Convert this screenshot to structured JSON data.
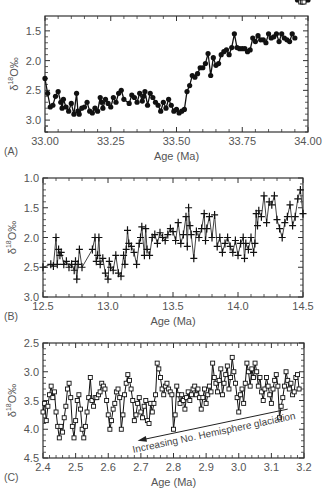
{
  "figure": {
    "panels": [
      "A",
      "B",
      "C"
    ]
  },
  "chart_data": [
    {
      "type": "line",
      "panel_label": "(A)",
      "title": "",
      "xlabel": "Age (Ma)",
      "ylabel": "δ18O‰",
      "ylabel_parts": {
        "delta": "δ",
        "sup": "18",
        "rest": "O‰"
      },
      "marker": "filled-circle",
      "y_inverted": true,
      "xlim": [
        33.0,
        34.0
      ],
      "ylim": [
        3.2,
        1.25
      ],
      "xticks": [
        33.0,
        33.25,
        33.5,
        33.75,
        34.0
      ],
      "xtick_labels": [
        "33.00",
        "33.25",
        "33.50",
        "33.75",
        "34.00"
      ],
      "yticks": [
        1.5,
        2.0,
        2.5,
        3.0
      ],
      "ytick_labels": [
        "1.5",
        "2.0",
        "2.5",
        "3.0"
      ],
      "frame_px": {
        "left": 45,
        "right": 308,
        "top": 16,
        "bottom": 132
      },
      "x": [
        33.0,
        33.01,
        33.02,
        33.03,
        33.04,
        33.05,
        33.06,
        33.065,
        33.07,
        33.08,
        33.09,
        33.1,
        33.11,
        33.12,
        33.125,
        33.13,
        33.14,
        33.15,
        33.16,
        33.17,
        33.18,
        33.19,
        33.2,
        33.21,
        33.215,
        33.22,
        33.23,
        33.24,
        33.25,
        33.26,
        33.27,
        33.28,
        33.29,
        33.3,
        33.32,
        33.33,
        33.34,
        33.35,
        33.36,
        33.37,
        33.375,
        33.38,
        33.39,
        33.4,
        33.41,
        33.42,
        33.43,
        33.44,
        33.45,
        33.46,
        33.47,
        33.48,
        33.49,
        33.5,
        33.51,
        33.52,
        33.53,
        33.54,
        33.55,
        33.56,
        33.57,
        33.58,
        33.59,
        33.6,
        33.61,
        33.62,
        33.63,
        33.64,
        33.65,
        33.66,
        33.67,
        33.68,
        33.69,
        33.7,
        33.71,
        33.72,
        33.73,
        33.74,
        33.75,
        33.76,
        33.77,
        33.78,
        33.79,
        33.8,
        33.81,
        33.82,
        33.83,
        33.84,
        33.85,
        33.86,
        33.87,
        33.88,
        33.89,
        33.9,
        33.91,
        33.92,
        33.93,
        33.94,
        33.95,
        33.96,
        33.97,
        33.98,
        33.99,
        34.0
      ],
      "values": [
        2.3,
        2.55,
        2.78,
        2.75,
        2.6,
        2.52,
        2.7,
        2.8,
        2.65,
        2.78,
        2.85,
        2.72,
        2.9,
        2.55,
        2.85,
        2.9,
        2.8,
        2.78,
        2.7,
        2.85,
        2.88,
        2.8,
        2.85,
        2.62,
        2.7,
        2.8,
        2.65,
        2.72,
        2.78,
        2.62,
        2.7,
        2.55,
        2.5,
        2.65,
        2.72,
        2.58,
        2.62,
        2.7,
        2.55,
        2.68,
        2.6,
        2.52,
        2.75,
        2.55,
        2.62,
        2.7,
        2.75,
        2.85,
        2.7,
        2.8,
        2.65,
        2.75,
        2.85,
        2.82,
        2.88,
        2.85,
        2.82,
        2.52,
        2.42,
        2.25,
        2.28,
        2.22,
        2.12,
        2.12,
        2.05,
        1.88,
        2.25,
        1.95,
        2.08,
        2.05,
        1.9,
        1.85,
        1.82,
        1.9,
        1.78,
        1.55,
        1.78,
        1.8,
        1.8,
        1.8,
        1.85,
        1.82,
        1.62,
        1.68,
        1.58,
        1.65,
        1.65,
        1.7,
        1.55,
        1.62,
        1.6,
        1.55,
        1.68,
        1.55,
        1.62,
        1.65,
        1.68,
        1.55,
        1.62
      ]
    },
    {
      "type": "line",
      "panel_label": "(B)",
      "title": "",
      "xlabel": "Age (Ma)",
      "ylabel": "δ18O‰",
      "ylabel_parts": {
        "delta": "δ",
        "sup": "18",
        "rest": "O‰"
      },
      "marker": "plus",
      "y_inverted": true,
      "xlim": [
        12.5,
        14.5
      ],
      "ylim": [
        3.0,
        1.0
      ],
      "xticks": [
        12.5,
        13.0,
        13.5,
        14.0,
        14.5
      ],
      "xtick_labels": [
        "12.5",
        "13.0",
        "13.5",
        "14.0",
        "14.5"
      ],
      "yticks": [
        1.0,
        1.5,
        2.0,
        2.5,
        3.0
      ],
      "ytick_labels": [
        "1.0",
        "1.5",
        "2.0",
        "2.5",
        "3.0"
      ],
      "frame_px": {
        "left": 43,
        "right": 303,
        "top": 178,
        "bottom": 297
      },
      "x": [
        12.5,
        12.56,
        12.58,
        12.6,
        12.61,
        12.62,
        12.63,
        12.64,
        12.66,
        12.68,
        12.7,
        12.72,
        12.74,
        12.75,
        12.76,
        12.77,
        12.78,
        12.8,
        12.88,
        12.9,
        12.91,
        12.92,
        12.93,
        12.94,
        12.96,
        12.98,
        13.0,
        13.01,
        13.02,
        13.04,
        13.06,
        13.08,
        13.1,
        13.12,
        13.13,
        13.14,
        13.15,
        13.16,
        13.18,
        13.2,
        13.22,
        13.24,
        13.25,
        13.26,
        13.28,
        13.29,
        13.3,
        13.32,
        13.34,
        13.36,
        13.38,
        13.4,
        13.42,
        13.44,
        13.46,
        13.48,
        13.5,
        13.52,
        13.54,
        13.56,
        13.58,
        13.6,
        13.61,
        13.62,
        13.63,
        13.64,
        13.66,
        13.68,
        13.7,
        13.72,
        13.74,
        13.75,
        13.76,
        13.78,
        13.8,
        13.82,
        13.84,
        13.86,
        13.88,
        13.9,
        13.92,
        13.94,
        13.96,
        13.98,
        14.0,
        14.02,
        14.04,
        14.05,
        14.06,
        14.08,
        14.1,
        14.12,
        14.13,
        14.14,
        14.15,
        14.16,
        14.18,
        14.2,
        14.22,
        14.24,
        14.26,
        14.28,
        14.3,
        14.32,
        14.34,
        14.36,
        14.38,
        14.4,
        14.42,
        14.44,
        14.46,
        14.48,
        14.5
      ],
      "values": [
        2.5,
        2.45,
        2.48,
        2.0,
        2.45,
        2.2,
        2.3,
        2.25,
        2.45,
        2.4,
        2.5,
        2.45,
        2.55,
        2.4,
        2.7,
        2.45,
        2.2,
        2.5,
        2.2,
        2.0,
        2.4,
        2.3,
        2.0,
        2.45,
        2.35,
        2.6,
        2.7,
        2.4,
        2.5,
        2.55,
        2.3,
        2.6,
        2.65,
        2.3,
        2.45,
        2.2,
        1.88,
        2.1,
        2.15,
        2.25,
        2.45,
        2.1,
        2.0,
        1.82,
        2.3,
        1.85,
        2.2,
        2.3,
        2.0,
        1.95,
        2.1,
        1.92,
        2.0,
        2.05,
        1.95,
        1.85,
        1.9,
        2.05,
        1.75,
        2.1,
        1.95,
        1.65,
        2.15,
        1.5,
        1.8,
        1.95,
        2.35,
        1.9,
        2.0,
        1.85,
        1.6,
        2.05,
        1.85,
        1.65,
        2.0,
        1.62,
        2.15,
        2.0,
        2.25,
        2.1,
        2.0,
        2.15,
        2.25,
        2.05,
        2.3,
        2.1,
        2.0,
        2.35,
        2.1,
        2.2,
        2.0,
        2.25,
        2.1,
        1.6,
        1.8,
        1.55,
        1.65,
        1.3,
        1.75,
        1.4,
        1.45,
        1.3,
        1.7,
        1.85,
        2.0,
        1.75,
        1.65,
        1.45,
        1.8,
        1.65,
        1.35,
        1.2,
        1.6
      ],
      "smoothed_line": true
    },
    {
      "type": "line",
      "panel_label": "(C)",
      "title": "",
      "xlabel": "Age (Ma)",
      "ylabel": "δ18O‰",
      "ylabel_parts": {
        "delta": "δ",
        "sup": "18",
        "rest": "O‰"
      },
      "marker": "open-square",
      "y_inverted": true,
      "xlim": [
        2.4,
        3.2
      ],
      "ylim": [
        4.5,
        2.5
      ],
      "xticks": [
        2.4,
        2.5,
        2.6,
        2.7,
        2.8,
        2.9,
        3.0,
        3.1,
        3.2
      ],
      "xtick_labels": [
        "2.4",
        "2.5",
        "2.6",
        "2.7",
        "2.8",
        "2.9",
        "3.0",
        "3.1",
        "3.2"
      ],
      "yticks": [
        2.5,
        3.0,
        3.5,
        4.0,
        4.5
      ],
      "ytick_labels": [
        "2.5",
        "3.0",
        "3.5",
        "4.0",
        "4.5"
      ],
      "frame_px": {
        "left": 43,
        "right": 304,
        "top": 343,
        "bottom": 458
      },
      "x": [
        2.4,
        2.405,
        2.41,
        2.415,
        2.42,
        2.425,
        2.43,
        2.435,
        2.44,
        2.445,
        2.45,
        2.455,
        2.46,
        2.465,
        2.47,
        2.475,
        2.48,
        2.485,
        2.49,
        2.495,
        2.5,
        2.505,
        2.51,
        2.515,
        2.52,
        2.525,
        2.53,
        2.535,
        2.54,
        2.545,
        2.55,
        2.555,
        2.56,
        2.565,
        2.57,
        2.575,
        2.58,
        2.585,
        2.59,
        2.595,
        2.6,
        2.605,
        2.61,
        2.615,
        2.62,
        2.625,
        2.63,
        2.635,
        2.64,
        2.645,
        2.65,
        2.655,
        2.66,
        2.665,
        2.67,
        2.675,
        2.68,
        2.685,
        2.69,
        2.695,
        2.7,
        2.705,
        2.71,
        2.715,
        2.72,
        2.725,
        2.73,
        2.735,
        2.74,
        2.745,
        2.75,
        2.755,
        2.76,
        2.765,
        2.77,
        2.775,
        2.78,
        2.785,
        2.79,
        2.795,
        2.8,
        2.805,
        2.81,
        2.815,
        2.82,
        2.825,
        2.83,
        2.835,
        2.84,
        2.845,
        2.85,
        2.855,
        2.86,
        2.865,
        2.87,
        2.875,
        2.88,
        2.885,
        2.89,
        2.895,
        2.9,
        2.905,
        2.91,
        2.915,
        2.92,
        2.925,
        2.93,
        2.935,
        2.94,
        2.945,
        2.95,
        2.955,
        2.96,
        2.965,
        2.97,
        2.975,
        2.98,
        2.985,
        2.99,
        2.995,
        3.0,
        3.005,
        3.01,
        3.015,
        3.02,
        3.025,
        3.03,
        3.035,
        3.04,
        3.045,
        3.05,
        3.055,
        3.06,
        3.065,
        3.07,
        3.075,
        3.08,
        3.085,
        3.09,
        3.095,
        3.1,
        3.105,
        3.11,
        3.115,
        3.12,
        3.125,
        3.13,
        3.135,
        3.14,
        3.145,
        3.15,
        3.155,
        3.16,
        3.165,
        3.17,
        3.175,
        3.18,
        3.185,
        3.19,
        3.195,
        3.2
      ],
      "values": [
        3.7,
        3.55,
        3.85,
        3.6,
        3.4,
        3.25,
        3.45,
        3.35,
        3.7,
        3.95,
        4.15,
        3.95,
        4.05,
        3.8,
        3.6,
        3.3,
        3.2,
        3.45,
        3.95,
        4.15,
        3.85,
        3.5,
        3.4,
        3.65,
        4.0,
        4.15,
        3.95,
        3.7,
        3.45,
        3.1,
        3.5,
        3.6,
        3.45,
        3.45,
        3.4,
        3.35,
        3.2,
        3.25,
        3.3,
        3.5,
        3.75,
        4.0,
        3.85,
        3.65,
        3.55,
        3.35,
        3.3,
        3.45,
        4.0,
        3.75,
        3.4,
        3.2,
        3.05,
        3.15,
        3.3,
        3.5,
        3.85,
        3.75,
        3.55,
        3.45,
        3.7,
        3.8,
        3.6,
        3.5,
        3.85,
        3.9,
        3.55,
        3.7,
        3.55,
        3.4,
        2.85,
        2.95,
        3.1,
        3.3,
        3.4,
        3.25,
        3.2,
        3.3,
        3.35,
        3.4,
        4.0,
        3.75,
        3.25,
        3.4,
        3.55,
        3.4,
        3.5,
        3.65,
        3.45,
        3.35,
        3.5,
        3.4,
        3.3,
        3.25,
        3.4,
        3.3,
        3.45,
        3.65,
        3.45,
        3.3,
        3.55,
        3.4,
        3.25,
        3.35,
        2.85,
        3.1,
        3.2,
        3.35,
        3.15,
        2.95,
        3.4,
        3.2,
        3.05,
        2.9,
        3.3,
        3.1,
        2.75,
        3.0,
        3.2,
        3.45,
        3.7,
        3.4,
        3.3,
        3.55,
        3.2,
        2.85,
        3.0,
        3.25,
        2.95,
        3.1,
        2.85,
        3.0,
        3.25,
        3.1,
        3.35,
        3.5,
        3.3,
        3.1,
        3.25,
        3.4,
        3.55,
        3.3,
        3.15,
        3.05,
        3.25,
        3.8,
        3.6,
        3.45,
        3.25,
        3.0,
        3.15,
        3.3,
        3.2,
        3.4,
        3.35,
        3.1,
        3.05,
        3.3
      ],
      "annotation": {
        "text": "Increasing No. Hemisphere glaciation",
        "arrow_from": [
          3.15,
          3.65
        ],
        "arrow_to": [
          2.69,
          4.2
        ]
      }
    }
  ]
}
